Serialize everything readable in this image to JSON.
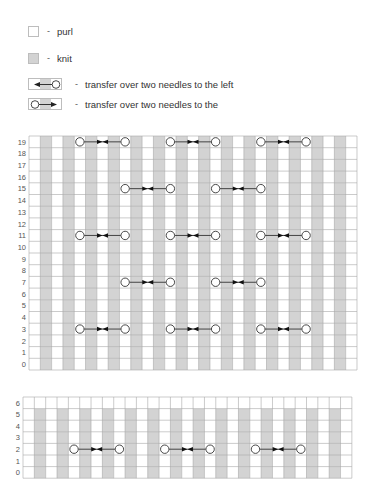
{
  "legend": {
    "items": [
      {
        "type": "purl",
        "label": "purl",
        "dash": "-"
      },
      {
        "type": "knit",
        "label": "knit",
        "dash": "-"
      },
      {
        "type": "transfer-left",
        "label": "transfer over two needles to the left",
        "dash": "-"
      },
      {
        "type": "transfer-right",
        "label": "transfer over two needles to the",
        "dash": "-"
      }
    ]
  },
  "colors": {
    "knit": "#d3d3d3",
    "purl": "#ffffff",
    "gridline": "#a8a8a8",
    "symbol": "#333333"
  },
  "charts": [
    {
      "name": "main-chart",
      "rows": 20,
      "columns": 29,
      "row_labels": [
        "0",
        "1",
        "2",
        "3",
        "4",
        "5",
        "6",
        "7",
        "8",
        "9",
        "10",
        "11",
        "12",
        "13",
        "14",
        "15",
        "16",
        "17",
        "18",
        "19"
      ],
      "knit_columns": "odd",
      "all_purl_rows": [],
      "transfers": [
        {
          "row": 19,
          "from_col": 4,
          "to_col": 8
        },
        {
          "row": 19,
          "from_col": 12,
          "to_col": 16
        },
        {
          "row": 19,
          "from_col": 20,
          "to_col": 24
        },
        {
          "row": 15,
          "from_col": 8,
          "to_col": 12
        },
        {
          "row": 15,
          "from_col": 16,
          "to_col": 20
        },
        {
          "row": 11,
          "from_col": 4,
          "to_col": 8
        },
        {
          "row": 11,
          "from_col": 12,
          "to_col": 16
        },
        {
          "row": 11,
          "from_col": 20,
          "to_col": 24
        },
        {
          "row": 7,
          "from_col": 8,
          "to_col": 12
        },
        {
          "row": 7,
          "from_col": 16,
          "to_col": 20
        },
        {
          "row": 3,
          "from_col": 4,
          "to_col": 8
        },
        {
          "row": 3,
          "from_col": 12,
          "to_col": 16
        },
        {
          "row": 3,
          "from_col": 20,
          "to_col": 24
        }
      ]
    },
    {
      "name": "bottom-chart",
      "rows": 7,
      "columns": 29,
      "row_labels": [
        "0",
        "1",
        "2",
        "3",
        "4",
        "5",
        "6"
      ],
      "knit_columns": "odd",
      "all_purl_rows": [
        6
      ],
      "transfers": [
        {
          "row": 2,
          "from_col": 4,
          "to_col": 8
        },
        {
          "row": 2,
          "from_col": 12,
          "to_col": 16
        },
        {
          "row": 2,
          "from_col": 20,
          "to_col": 24
        }
      ]
    }
  ]
}
